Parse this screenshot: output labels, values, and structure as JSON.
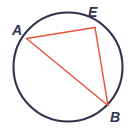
{
  "figure": {
    "type": "geometry-diagram",
    "canvas": {
      "width": 132,
      "height": 134,
      "background": "#ffffff"
    },
    "colors": {
      "circle_stroke": "#33334d",
      "chord_stroke": "#e8553c",
      "label_color": "#33334d"
    },
    "circle": {
      "name": "circumscribed-circle",
      "cx": 68,
      "cy": 67,
      "r": 54.5,
      "stroke_width": 2.1
    },
    "points": [
      {
        "id": "A",
        "label": "A",
        "x": 26.5,
        "y": 38.5,
        "label_x": 12,
        "label_y": 23
      },
      {
        "id": "E",
        "label": "E",
        "x": 95.0,
        "y": 27.5,
        "label_x": 88,
        "label_y": 5
      },
      {
        "id": "B",
        "label": "B",
        "x": 108.0,
        "y": 105.5,
        "label_x": 110,
        "label_y": 110
      }
    ],
    "segments": [
      {
        "id": "AE",
        "name": "chord-a-e",
        "from": "A",
        "to": "E",
        "x1": 26.5,
        "y1": 38.5,
        "x2": 95.0,
        "y2": 27.5,
        "stroke_width": 1.5
      },
      {
        "id": "EB",
        "name": "chord-e-b",
        "from": "E",
        "to": "B",
        "x1": 95.0,
        "y1": 27.5,
        "x2": 108.0,
        "y2": 105.5,
        "stroke_width": 1.5
      },
      {
        "id": "AB",
        "name": "chord-a-b",
        "from": "A",
        "to": "B",
        "x1": 26.5,
        "y1": 38.5,
        "x2": 108.0,
        "y2": 105.5,
        "stroke_width": 1.5
      }
    ]
  }
}
